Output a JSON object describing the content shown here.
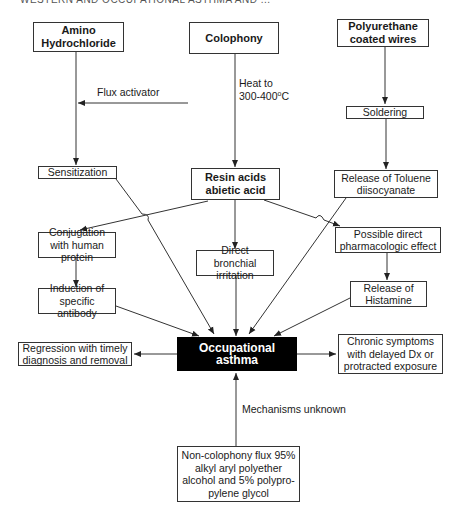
{
  "header": {
    "running_title": "WESTERN AND OCCUPATIONAL ASTHMA AND ..."
  },
  "sources": {
    "amino": "Amino Hydrochloride",
    "colophony": "Colophony",
    "polyurethane": "Polyurethane coated wires"
  },
  "edge_labels": {
    "flux_activator": "Flux activator",
    "heat_line1": "Heat to",
    "heat_line2_prefix": "300-400",
    "heat_degree": "o",
    "heat_unit": "C",
    "mechanisms_unknown": "Mechanisms unknown"
  },
  "intermediates": {
    "soldering": "Soldering",
    "sensitization": "Sensitization",
    "resin": "Resin acids abietic acid",
    "toluene": "Release of Toluene diisocyanate",
    "conjugation": "Conjugation with human protein",
    "bronchial": "Direct bronchial irritation",
    "pharmacologic": "Possible direct pharmacologic effect",
    "antibody": "Induction of specific antibody",
    "histamine": "Release of Histamine"
  },
  "center": {
    "label": "Occupational asthma"
  },
  "outcomes": {
    "regression": "Regression with timely diagnosis and removal",
    "chronic": "Chronic symptoms with delayed Dx or protracted exposure"
  },
  "bottom": {
    "non_colophony": "Non-colophony flux 95% alkyl aryl polyether alcohol and 5% polypro-pylene glycol"
  },
  "colors": {
    "line": "#333333",
    "center_fill": "#000000",
    "center_text": "#ffffff"
  }
}
